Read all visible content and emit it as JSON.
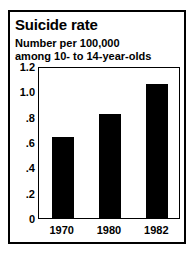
{
  "chart_data": {
    "type": "bar",
    "title": "Suicide rate",
    "subtitle_lines": [
      "Number per 100,000",
      "among 10- to 14-year-olds"
    ],
    "categories": [
      "1970",
      "1980",
      "1982"
    ],
    "values": [
      0.64,
      0.82,
      1.06
    ],
    "series": [
      {
        "name": "Suicide rate per 100,000 among 10- to 14-year-olds",
        "values": [
          0.64,
          0.82,
          1.06
        ]
      }
    ],
    "xlabel": "",
    "ylabel": "",
    "ylim": [
      0,
      1.2
    ],
    "y_ticks": [
      0,
      0.2,
      0.4,
      0.6,
      0.8,
      1.0,
      1.2
    ],
    "y_tick_labels": [
      "0",
      ".2",
      ".4",
      ".6",
      ".8",
      "1.0",
      "1.2"
    ],
    "grid": false,
    "legend": "none",
    "bar_color": "#000000",
    "background_color": "#ffffff",
    "frame_color": "#000000"
  }
}
